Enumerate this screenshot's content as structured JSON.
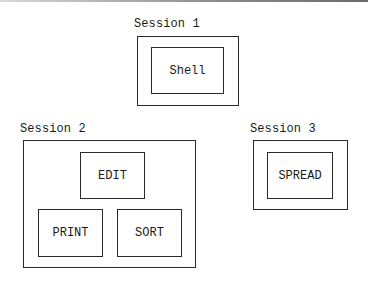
{
  "sessions": [
    {
      "label": "Session 1",
      "programs": [
        "Shell"
      ]
    },
    {
      "label": "Session 2",
      "programs": [
        "EDIT",
        "PRINT",
        "SORT"
      ]
    },
    {
      "label": "Session 3",
      "programs": [
        "SPREAD"
      ]
    }
  ]
}
